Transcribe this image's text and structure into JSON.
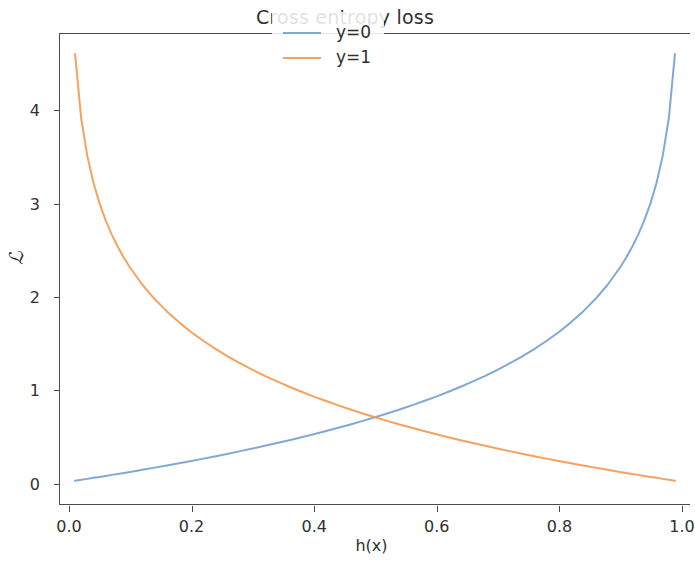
{
  "figure": {
    "width": 690,
    "height": 561,
    "background": "#ffffff"
  },
  "chart_data": {
    "type": "line",
    "title": "Cross entropy loss",
    "xlabel": "h(x)",
    "ylabel": "ℒ",
    "xlim": [
      -0.0146,
      1.0146
    ],
    "ylim": [
      -0.2405,
      4.8194
    ],
    "grid": false,
    "legend_position": "upper center",
    "xticks": [
      0.0,
      0.2,
      0.4,
      0.6,
      0.8,
      1.0
    ],
    "xtick_labels": [
      "0.0",
      "0.2",
      "0.4",
      "0.6",
      "0.8",
      "1.0"
    ],
    "yticks": [
      0,
      1,
      2,
      3,
      4
    ],
    "ytick_labels": [
      "0",
      "1",
      "2",
      "3",
      "4"
    ],
    "x": [
      0.01,
      0.02,
      0.03,
      0.04,
      0.05,
      0.06,
      0.07,
      0.08,
      0.09,
      0.1,
      0.12,
      0.14,
      0.16,
      0.18,
      0.2,
      0.22,
      0.24,
      0.26,
      0.28,
      0.3,
      0.32,
      0.34,
      0.36,
      0.38,
      0.4,
      0.42,
      0.44,
      0.46,
      0.48,
      0.5,
      0.52,
      0.54,
      0.56,
      0.58,
      0.6,
      0.62,
      0.64,
      0.66,
      0.68,
      0.7,
      0.72,
      0.74,
      0.76,
      0.78,
      0.8,
      0.82,
      0.84,
      0.86,
      0.88,
      0.9,
      0.91,
      0.92,
      0.93,
      0.94,
      0.95,
      0.96,
      0.97,
      0.98,
      0.99
    ],
    "series": [
      {
        "name": "y=0",
        "color": "#7fa9d6",
        "formula": "-ln(1 - h)",
        "linewidth": 2.0,
        "values": [
          0.01,
          0.02,
          0.03,
          0.041,
          0.051,
          0.062,
          0.073,
          0.083,
          0.094,
          0.105,
          0.128,
          0.151,
          0.174,
          0.198,
          0.223,
          0.248,
          0.274,
          0.301,
          0.329,
          0.357,
          0.386,
          0.416,
          0.446,
          0.478,
          0.511,
          0.545,
          0.58,
          0.616,
          0.654,
          0.693,
          0.734,
          0.777,
          0.821,
          0.868,
          0.916,
          0.968,
          1.022,
          1.079,
          1.139,
          1.204,
          1.273,
          1.347,
          1.427,
          1.514,
          1.609,
          1.715,
          1.833,
          1.966,
          2.12,
          2.303,
          2.408,
          2.526,
          2.659,
          2.813,
          2.996,
          3.219,
          3.507,
          3.912,
          4.605
        ]
      },
      {
        "name": "y=1",
        "color": "#f5a25e",
        "formula": "-ln(h)",
        "linewidth": 2.0,
        "values": [
          4.605,
          3.912,
          3.507,
          3.219,
          2.996,
          2.813,
          2.659,
          2.526,
          2.408,
          2.303,
          2.12,
          1.966,
          1.833,
          1.715,
          1.609,
          1.514,
          1.427,
          1.347,
          1.273,
          1.204,
          1.139,
          1.079,
          1.022,
          0.968,
          0.916,
          0.868,
          0.821,
          0.777,
          0.734,
          0.693,
          0.654,
          0.616,
          0.58,
          0.545,
          0.511,
          0.478,
          0.446,
          0.416,
          0.386,
          0.357,
          0.329,
          0.301,
          0.274,
          0.248,
          0.223,
          0.198,
          0.174,
          0.151,
          0.128,
          0.105,
          0.094,
          0.083,
          0.073,
          0.062,
          0.051,
          0.041,
          0.03,
          0.02,
          0.01
        ]
      }
    ],
    "annotations": [
      {
        "text": "curves intersect at h(x)=0.5, ℒ≈0.69"
      }
    ]
  },
  "legend": {
    "entries": [
      {
        "label": "y=0",
        "color": "#7fa9d6"
      },
      {
        "label": "y=1",
        "color": "#f5a25e"
      }
    ]
  }
}
